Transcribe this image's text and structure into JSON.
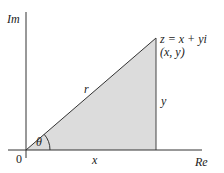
{
  "diagram": {
    "axes": {
      "vertical_label": "Im",
      "horizontal_label": "Re",
      "origin_label": "0"
    },
    "point": {
      "equation": "z = x + yi",
      "coordinates": "(x, y)"
    },
    "segments": {
      "hypotenuse_label": "r",
      "adjacent_label": "x",
      "opposite_label": "y",
      "angle_label": "θ"
    },
    "colors": {
      "shade": "#d9d9d9",
      "line": "#333333",
      "text": "#222222"
    }
  }
}
